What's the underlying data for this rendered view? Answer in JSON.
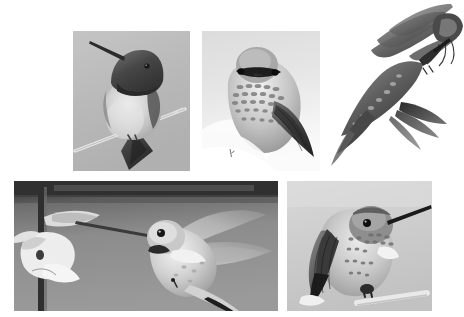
{
  "page": {
    "background_color": "#ffffff",
    "width": 464,
    "height": 317,
    "color_mode": "grayscale",
    "layout": "five-panel photo collage, two rows"
  },
  "panels": [
    {
      "id": "panel-a",
      "name": "perched-male-hummingbird",
      "position": "top-left",
      "x": 73,
      "y": 31,
      "width": 117,
      "height": 140,
      "subject": "Male hummingbird perched on a thin bare twig, facing the viewer",
      "background_color": "#b9b9b9",
      "notable_features": "dark iridescent gorget and crown, pale buff breast, long straight black bill pointing upper-left, long dark tail angled down-left, twig running diagonally lower-left to right",
      "border": "none"
    },
    {
      "id": "panel-b",
      "name": "fluffed-hummingbird-head-on",
      "position": "top-center",
      "x": 202,
      "y": 31,
      "width": 118,
      "height": 140,
      "subject": "Hummingbird seen head-on with fluffed speckled plumage",
      "background_color": "#e4e4e4",
      "notable_features": "rounded pale head, dark eye mask band across the face, heavily mottled white-and-grey breast, dark folded wing sweeping to the lower right, very bright blown-out white lower background",
      "border": "none"
    },
    {
      "id": "panel-c",
      "name": "hummingbird-feeding-at-tubular-flower",
      "position": "top-right",
      "x": 327,
      "y": 2,
      "width": 137,
      "height": 172,
      "subject": "Hummingbird in flight below a cluster of tubular flowers, seen from behind and below",
      "background_color": "#ffffff",
      "notable_features": "no photo border, subject floats on white; long dark tubular flower petals radiating upper-left; bird's spread tail and wings fanned downward-left; bill inserted into the flower",
      "border": "none"
    },
    {
      "id": "panel-d",
      "name": "hovering-hummingbird-at-flower",
      "position": "bottom-left",
      "x": 14,
      "y": 181,
      "width": 264,
      "height": 130,
      "subject": "Hummingbird hovering with wings spread, bill inserted into a pale flower on a stem",
      "background_color": "#8a8a8a",
      "notable_features": "dark upper band across the top of the frame, vertical dark stem at far left, white/pale open flower and bud at left, long needle bill, translucent blurred wings spread up-right, dark-tipped tail at lower right",
      "border": "none"
    },
    {
      "id": "panel-e",
      "name": "perched-hummingbird-profile",
      "position": "bottom-right",
      "x": 287,
      "y": 181,
      "width": 145,
      "height": 130,
      "subject": "Hummingbird perched on a pale twig in three-quarter profile, bill pointing right",
      "background_color": "#cfcfcf",
      "notable_features": "speckled throat and breast, dark scaled back and folded wing, white patch below the throat, long straight black bill to the upper right, feet gripping a pale diagonal perch at lower right",
      "border": "none"
    }
  ],
  "palette": {
    "page_white": "#ffffff",
    "panel_a_sky": "#b9b9b9",
    "panel_b_sky": "#e4e4e4",
    "panel_d_sky": "#8a8a8a",
    "panel_d_band": "#3a3a3a",
    "panel_e_sky": "#cfcfcf",
    "feather_dark": "#4a4a4a",
    "feather_mid": "#8f8f8f",
    "feather_light": "#d6d6d6",
    "bill_black": "#2a2a2a",
    "highlight_white": "#f4f4f4"
  }
}
